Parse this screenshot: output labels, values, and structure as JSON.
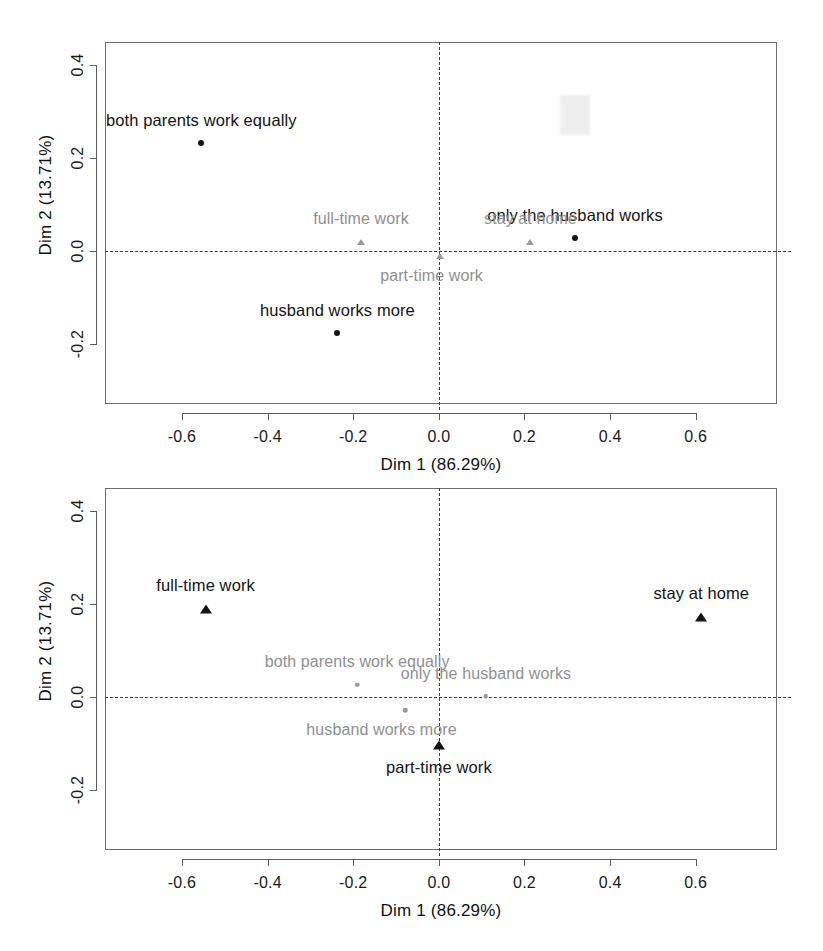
{
  "figure": {
    "kind": "mca-factor-maps",
    "panel_count": 2
  },
  "axis": {
    "xlabel": "Dim 1 (86.29%)",
    "ylabel": "Dim 2 (13.71%)",
    "xticks": [
      "-0.6",
      "-0.4",
      "-0.2",
      "0.0",
      "0.2",
      "0.4",
      "0.6"
    ],
    "yticks": [
      "0.4",
      "0.2",
      "0.0",
      "-0.2"
    ]
  },
  "chart_data": [
    {
      "type": "scatter",
      "panel": "top",
      "title": "",
      "xlabel": "Dim 1 (86.29%)",
      "ylabel": "Dim 2 (13.71%)",
      "xlim": [
        -0.78,
        0.79
      ],
      "ylim": [
        -0.33,
        0.45
      ],
      "xticks": [
        -0.6,
        -0.4,
        -0.2,
        0.0,
        0.2,
        0.4,
        0.6
      ],
      "yticks": [
        0.4,
        0.2,
        0.0,
        -0.2
      ],
      "grid": false,
      "reference_lines": {
        "h": 0.0,
        "v": 0.0,
        "style": "dashed"
      },
      "legend": "none",
      "series": [
        {
          "name": "emphasized",
          "marker": "circle",
          "color": "#141414",
          "label_color": "#141414",
          "points": [
            {
              "label": "both parents work equally",
              "x": -0.555,
              "y": 0.232,
              "label_dx": 0.0,
              "label_dy": 0.048
            },
            {
              "label": "husband works more",
              "x": -0.237,
              "y": -0.178,
              "label_dx": 0.0,
              "label_dy": 0.048
            },
            {
              "label": "only the husband works",
              "x": 0.318,
              "y": 0.027,
              "label_dx": 0.0,
              "label_dy": 0.048
            }
          ]
        },
        {
          "name": "faded",
          "marker": "triangle",
          "color": "#9a9a9a",
          "label_color": "#8f8f8f",
          "points": [
            {
              "label": "full-time work",
              "x": -0.182,
              "y": 0.02,
              "label_dx": 0.0,
              "label_dy": 0.046
            },
            {
              "label": "stay at home",
              "x": 0.214,
              "y": 0.02,
              "label_dx": 0.0,
              "label_dy": 0.046
            },
            {
              "label": "part-time work",
              "x": 0.003,
              "y": -0.012,
              "label_dx": -0.02,
              "label_dy": -0.044
            }
          ]
        }
      ]
    },
    {
      "type": "scatter",
      "panel": "bottom",
      "title": "",
      "xlabel": "Dim 1 (86.29%)",
      "ylabel": "Dim 2 (13.71%)",
      "xlim": [
        -0.78,
        0.79
      ],
      "ylim": [
        -0.33,
        0.45
      ],
      "xticks": [
        -0.6,
        -0.4,
        -0.2,
        0.0,
        0.2,
        0.4,
        0.6
      ],
      "yticks": [
        0.4,
        0.2,
        0.0,
        -0.2
      ],
      "grid": false,
      "reference_lines": {
        "h": 0.0,
        "v": 0.0,
        "style": "dashed"
      },
      "legend": "none",
      "series": [
        {
          "name": "emphasized",
          "marker": "triangle",
          "color": "#141414",
          "label_color": "#141414",
          "points": [
            {
              "label": "full-time work",
              "x": -0.545,
              "y": 0.19,
              "label_dx": 0.0,
              "label_dy": 0.048
            },
            {
              "label": "stay at home",
              "x": 0.613,
              "y": 0.173,
              "label_dx": 0.0,
              "label_dy": 0.048
            },
            {
              "label": "part-time work",
              "x": 0.0,
              "y": -0.103,
              "label_dx": 0.0,
              "label_dy": -0.05
            }
          ]
        },
        {
          "name": "faded",
          "marker": "circle",
          "color": "#9a9a9a",
          "label_color": "#8f8f8f",
          "points": [
            {
              "label": "both parents work equally",
              "x": -0.191,
              "y": 0.026,
              "label_dx": 0.0,
              "label_dy": 0.046
            },
            {
              "label": "husband works more",
              "x": -0.079,
              "y": -0.029,
              "label_dx": -0.055,
              "label_dy": -0.044
            },
            {
              "label": "only the husband works",
              "x": 0.11,
              "y": 0.001,
              "label_dx": 0.0,
              "label_dy": 0.046
            }
          ]
        }
      ]
    }
  ],
  "colors": {
    "emphasized": "#141414",
    "faded": "#9a9a9a",
    "frame": "#6d6d6d",
    "refline": "#3a3a3a",
    "background": "#ffffff"
  }
}
